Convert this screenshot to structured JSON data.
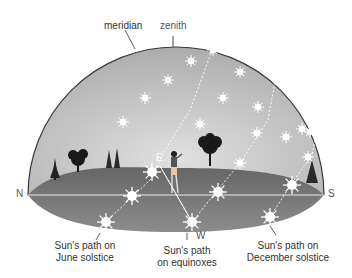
{
  "diagram": {
    "labels": {
      "meridian": "meridian",
      "zenith": "zenith"
    },
    "directions": {
      "north": "N",
      "south": "S",
      "east": "E",
      "west": "W"
    },
    "paths": [
      {
        "id": "june",
        "line1": "Sun's path on",
        "line2": "June solstice"
      },
      {
        "id": "equinox",
        "line1": "Sun's path",
        "line2": "on equinoxes"
      },
      {
        "id": "december",
        "line1": "Sun's path on",
        "line2": "December solstice"
      }
    ],
    "colors": {
      "sky_dome": "#b8b8b8",
      "ground_top": "#6e6e6e",
      "ground_bottom": "#8a8a8a",
      "horizon_line": "#e8e8e8",
      "dome_outline": "#3a3a3a",
      "sun": "#ffffff"
    }
  }
}
